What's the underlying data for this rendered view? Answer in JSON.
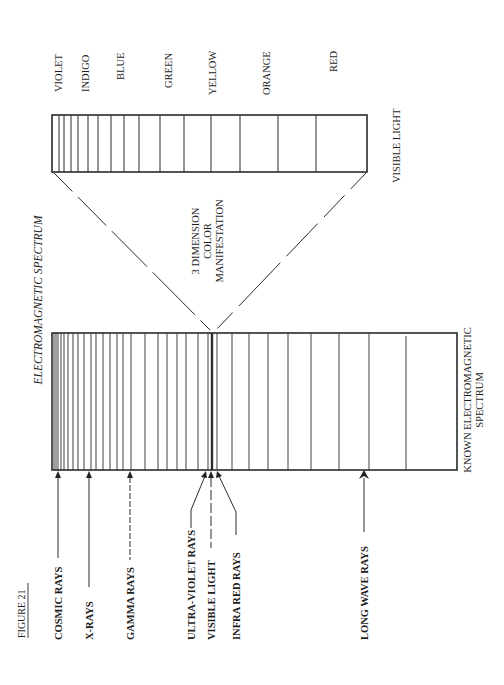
{
  "figure": {
    "label": "FIGURE 21",
    "title": "ELECTROMAGNETIC SPECTRUM"
  },
  "visible_box": {
    "caption": "VISIBLE LIGHT",
    "colors": [
      "VIOLET",
      "INDIGO",
      "BLUE",
      "GREEN",
      "YELLOW",
      "ORANGE",
      "RED"
    ]
  },
  "center_note": {
    "lines": [
      "3 DIMENSION",
      "COLOR",
      "MANIFESTATION"
    ]
  },
  "spectrum_box": {
    "caption_lines": [
      "KNOWN ELECTROMAGNETIC",
      "SPECTRUM"
    ]
  },
  "ray_labels": [
    "COSMIC RAYS",
    "X-RAYS",
    "GAMMA RAYS",
    "ULTRA-VIOLET RAYS",
    "VISIBLE LIGHT",
    "INFRA RED RAYS",
    "LONG WAVE RAYS"
  ]
}
